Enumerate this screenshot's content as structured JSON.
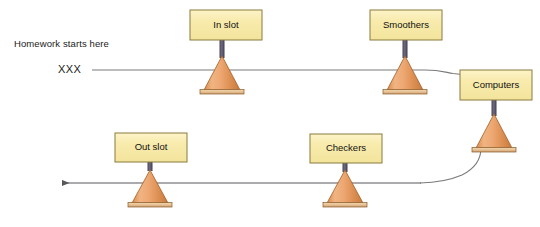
{
  "diagram": {
    "annotations": [
      {
        "id": "homework-start",
        "text": "Homework starts here",
        "x": 14,
        "y": 38
      },
      {
        "id": "xxx-marker",
        "text": "XXX",
        "x": 58,
        "y": 63
      }
    ],
    "nodes": [
      {
        "id": "in-slot",
        "label": "In slot",
        "box": {
          "x": 190,
          "y": 10,
          "w": 72,
          "h": 30
        },
        "cone": {
          "cx": 222,
          "apex_y": 56,
          "base_y": 90,
          "half_w": 18
        }
      },
      {
        "id": "smoothers",
        "label": "Smoothers",
        "box": {
          "x": 370,
          "y": 10,
          "w": 72,
          "h": 30
        },
        "cone": {
          "cx": 405,
          "apex_y": 56,
          "base_y": 90,
          "half_w": 18
        }
      },
      {
        "id": "computers",
        "label": "Computers",
        "box": {
          "x": 460,
          "y": 70,
          "w": 72,
          "h": 30
        },
        "cone": {
          "cx": 494,
          "apex_y": 114,
          "base_y": 148,
          "half_w": 18
        }
      },
      {
        "id": "checkers",
        "label": "Checkers",
        "box": {
          "x": 310,
          "y": 134,
          "w": 72,
          "h": 29
        },
        "cone": {
          "cx": 345,
          "apex_y": 170,
          "base_y": 203,
          "half_w": 18
        }
      },
      {
        "id": "out-slot",
        "label": "Out slot",
        "box": {
          "x": 115,
          "y": 133,
          "w": 72,
          "h": 29
        },
        "cone": {
          "cx": 150,
          "apex_y": 170,
          "base_y": 203,
          "half_w": 18
        }
      }
    ],
    "flow": {
      "top_line_y": 70,
      "bottom_line_y": 183,
      "top_line_start_x": 92,
      "bottom_line_end_x": 62,
      "arrow_direction": "left"
    },
    "colors": {
      "box_fill": "#f7e9a8",
      "box_fill_top": "#fbf0bd",
      "box_stroke": "#8a7a3c",
      "cone_fill_light": "#f0b07c",
      "cone_fill_mid": "#e09352",
      "cone_fill_dark": "#c4743a",
      "cone_stroke": "#9c5a24",
      "base_plate": "#e8c49a",
      "base_plate_stroke": "#8a5a2a",
      "stem": "#5a5468",
      "line": "#6d6d6d",
      "text": "#111111",
      "background": "#ffffff"
    }
  }
}
